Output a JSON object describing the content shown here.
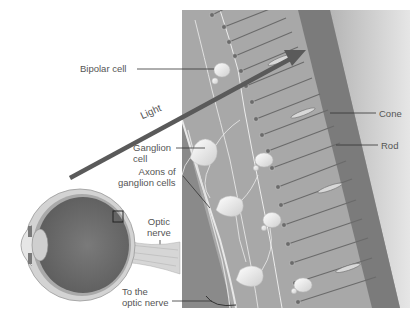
{
  "figure": {
    "type": "retina-cross-section",
    "colors": {
      "background": "#ffffff",
      "retina_tissue": "#a9a9a9",
      "pigment_layer": "#7d7d7d",
      "choroid": "#c8c8c8",
      "cells": "#f2f2f2",
      "light_arrow": "#555555",
      "eyeball_interior": "#6e6e6e",
      "label_text": "#555555"
    }
  },
  "labels": {
    "bipolar_cell": "Bipolar cell",
    "light": "Light",
    "ganglion_cell_line1": "Ganglion",
    "ganglion_cell_line2": "cell",
    "axons_line1": "Axons of",
    "axons_line2": "ganglion cells",
    "optic_nerve_line1": "Optic",
    "optic_nerve_line2": "nerve",
    "to_optic_nerve_line1": "To the",
    "to_optic_nerve_line2": "optic nerve",
    "cone": "Cone",
    "rod": "Rod"
  }
}
